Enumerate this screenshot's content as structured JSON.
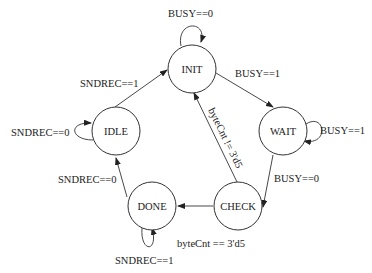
{
  "diagram": {
    "type": "state-machine",
    "states": [
      {
        "id": "init",
        "label": "INIT"
      },
      {
        "id": "wait",
        "label": "WAIT"
      },
      {
        "id": "idle",
        "label": "IDLE"
      },
      {
        "id": "done",
        "label": "DONE"
      },
      {
        "id": "check",
        "label": "CHECK"
      }
    ],
    "transitions": [
      {
        "from": "INIT",
        "to": "INIT",
        "label": "BUSY==0"
      },
      {
        "from": "INIT",
        "to": "WAIT",
        "label": "BUSY==1"
      },
      {
        "from": "WAIT",
        "to": "WAIT",
        "label": "BUSY==1"
      },
      {
        "from": "WAIT",
        "to": "CHECK",
        "label": "BUSY==0"
      },
      {
        "from": "CHECK",
        "to": "INIT",
        "label": "byteCnt != 3'd5"
      },
      {
        "from": "CHECK",
        "to": "DONE",
        "label": "byteCnt == 3'd5"
      },
      {
        "from": "DONE",
        "to": "DONE",
        "label": "SNDREC==1"
      },
      {
        "from": "DONE",
        "to": "IDLE",
        "label": "SNDREC==0"
      },
      {
        "from": "IDLE",
        "to": "IDLE",
        "label": "SNDREC==0"
      },
      {
        "from": "IDLE",
        "to": "INIT",
        "label": "SNDREC==1"
      }
    ]
  }
}
